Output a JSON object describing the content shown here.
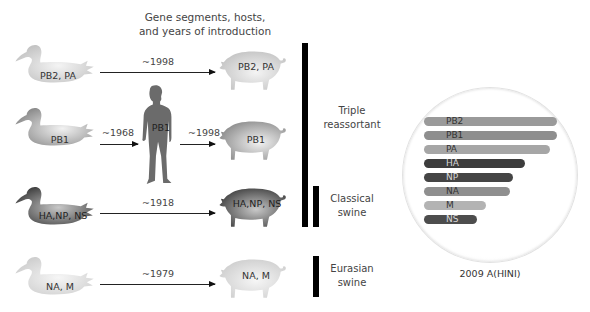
{
  "title": {
    "line1": "Gene segments, hosts,",
    "line2": "and years of introduction"
  },
  "rows": [
    {
      "source": {
        "host": "duck",
        "label": "PB2, PA",
        "shade": "light"
      },
      "arrows": [
        {
          "year": "~1998"
        }
      ],
      "target": {
        "host": "pig",
        "label": "PB2, PA",
        "shade": "light"
      }
    },
    {
      "source": {
        "host": "duck",
        "label": "PB1",
        "shade": "medium-light"
      },
      "intermediate": {
        "host": "human",
        "label": "PB1"
      },
      "arrows": [
        {
          "year": "~1968"
        },
        {
          "year": "~1998"
        }
      ],
      "target": {
        "host": "pig",
        "label": "PB1",
        "shade": "medium-light"
      }
    },
    {
      "source": {
        "host": "duck",
        "label": "HA,NP, NS",
        "shade": "dark"
      },
      "arrows": [
        {
          "year": "~1918"
        }
      ],
      "target": {
        "host": "pig",
        "label": "HA,NP, NS",
        "shade": "dark"
      }
    },
    {
      "source": {
        "host": "duck",
        "label": "NA, M",
        "shade": "lightest"
      },
      "arrows": [
        {
          "year": "~1979"
        }
      ],
      "target": {
        "host": "pig",
        "label": "NA, M",
        "shade": "lightest"
      }
    }
  ],
  "lineages": [
    {
      "line1": "Triple",
      "line2": "reassortant"
    },
    {
      "line1": "Classical",
      "line2": "swine"
    },
    {
      "line1": "Eurasian",
      "line2": "swine"
    }
  ],
  "virus": {
    "caption": "2009 A(HINI)",
    "segments": [
      {
        "name": "PB2",
        "color": "#9a9a9a",
        "width": 133
      },
      {
        "name": "PB1",
        "color": "#8e8e8e",
        "width": 133
      },
      {
        "name": "PA",
        "color": "#a6a6a6",
        "width": 126
      },
      {
        "name": "HA",
        "color": "#3c3c3c",
        "width": 101
      },
      {
        "name": "NP",
        "color": "#454545",
        "width": 89
      },
      {
        "name": "NA",
        "color": "#8f8f8f",
        "width": 86
      },
      {
        "name": "M",
        "color": "#b3b3b3",
        "width": 62
      },
      {
        "name": "NS",
        "color": "#4d4d4d",
        "width": 53
      }
    ]
  },
  "colors": {
    "bar": "#000000",
    "light": "#d2d2d2",
    "mediumLight": "#bdbdbd",
    "dark": "#5a5a5a",
    "lightest": "#dadada",
    "human": "#6a6a6a"
  }
}
